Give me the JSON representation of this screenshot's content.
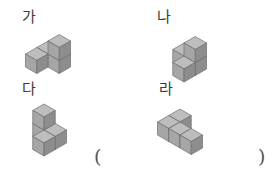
{
  "page": {
    "background_color": "#ffffff",
    "kind": "multiple-choice-figure-question"
  },
  "cube_style": {
    "top_face_color": "#bdbdbd",
    "left_face_color": "#a6a6a6",
    "right_face_color": "#8d8d8d",
    "edge_color": "#6e6e6e",
    "cube_size": 13,
    "edge_width": 0.7
  },
  "figures": [
    {
      "id": "ga",
      "label": "가",
      "description": "staircase of four cubes: bottom row of three, one cube stacked on the right",
      "origin": {
        "x": 48,
        "y": 52
      },
      "cubes": [
        {
          "x": 0,
          "y": 0,
          "z": 0
        },
        {
          "x": 1,
          "y": 0,
          "z": 0
        },
        {
          "x": 1,
          "y": 0,
          "z": 1
        },
        {
          "x": 0,
          "y": 1,
          "z": 0
        }
      ]
    },
    {
      "id": "na",
      "label": "나",
      "description": "four cubes in an L/T arrangement with one cube raised on top",
      "origin": {
        "x": 44,
        "y": 54
      },
      "cubes": [
        {
          "x": 0,
          "y": 0,
          "z": 0
        },
        {
          "x": 1,
          "y": 0,
          "z": 0
        },
        {
          "x": 1,
          "y": 1,
          "z": 0
        },
        {
          "x": 1,
          "y": 0,
          "z": 1
        }
      ]
    },
    {
      "id": "da",
      "label": "다",
      "description": "four cubes: an L of three on the ground with one cube stacked at the corner",
      "origin": {
        "x": 44,
        "y": 54
      },
      "cubes": [
        {
          "x": 0,
          "y": 0,
          "z": 0
        },
        {
          "x": 1,
          "y": 0,
          "z": 0
        },
        {
          "x": 1,
          "y": 1,
          "z": 0
        },
        {
          "x": 0,
          "y": 0,
          "z": 1
        }
      ]
    },
    {
      "id": "ra",
      "label": "라",
      "description": "four cubes lying flat in an S / Z zig-zag, no stacking",
      "origin": {
        "x": 40,
        "y": 46
      },
      "cubes": [
        {
          "x": 0,
          "y": 0,
          "z": 0
        },
        {
          "x": 0,
          "y": 1,
          "z": 0
        },
        {
          "x": 1,
          "y": 1,
          "z": 0
        },
        {
          "x": 2,
          "y": 1,
          "z": 0
        }
      ]
    }
  ],
  "answer": {
    "open_paren": "(",
    "close_paren": ")",
    "value": ""
  }
}
